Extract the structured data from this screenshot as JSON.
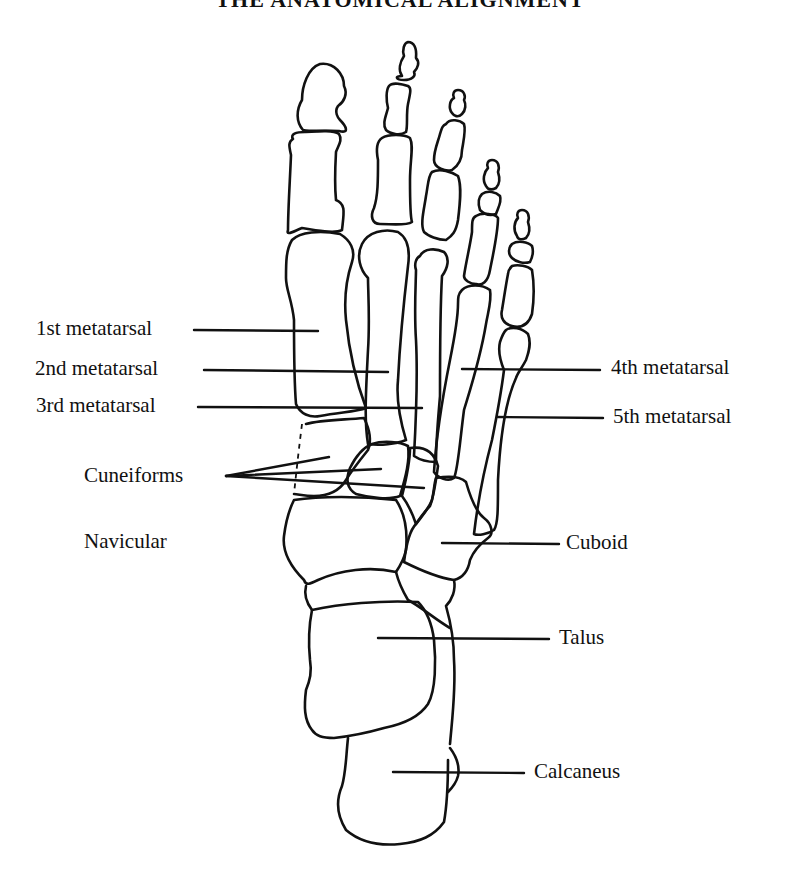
{
  "title": "THE ANATOMICAL ALIGNMENT",
  "figure": {
    "line_color": "#111111",
    "background": "#ffffff"
  },
  "labels": {
    "left": [
      {
        "id": "first_metatarsal",
        "text": "1st metatarsal"
      },
      {
        "id": "second_metatarsal",
        "text": "2nd metatarsal"
      },
      {
        "id": "third_metatarsal",
        "text": "3rd metatarsal"
      },
      {
        "id": "cuneiforms",
        "text": "Cuneiforms"
      },
      {
        "id": "navicular",
        "text": "Navicular"
      }
    ],
    "right": [
      {
        "id": "fourth_metatarsal",
        "text": "4th metatarsal"
      },
      {
        "id": "fifth_metatarsal",
        "text": "5th metatarsal"
      },
      {
        "id": "cuboid",
        "text": "Cuboid"
      },
      {
        "id": "talus",
        "text": "Talus"
      },
      {
        "id": "calcaneus",
        "text": "Calcaneus"
      }
    ]
  }
}
